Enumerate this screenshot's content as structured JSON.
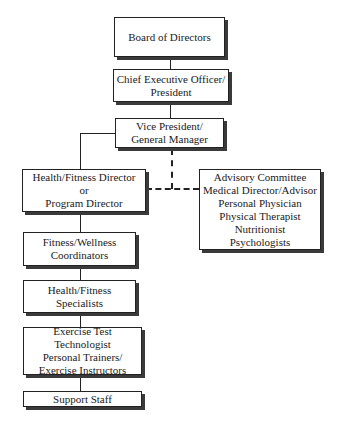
{
  "chart": {
    "type": "org-chart",
    "nodes": [
      {
        "id": "board",
        "lines": [
          "Board of Directors"
        ]
      },
      {
        "id": "ceo",
        "lines": [
          "Chief Executive Officer/",
          "President"
        ]
      },
      {
        "id": "vp",
        "lines": [
          "Vice President/",
          "General Manager"
        ]
      },
      {
        "id": "director",
        "lines": [
          "Health/Fitness Director",
          "or",
          "Program Director"
        ]
      },
      {
        "id": "advisory",
        "lines": [
          "Advisory Committee",
          "Medical Director/Advisor",
          "Personal Physician",
          "Physical Therapist",
          "Nutritionist",
          "Psychologists"
        ]
      },
      {
        "id": "coordinators",
        "lines": [
          "Fitness/Wellness",
          "Coordinators"
        ]
      },
      {
        "id": "specialists",
        "lines": [
          "Health/Fitness",
          "Specialists"
        ]
      },
      {
        "id": "exercise",
        "lines": [
          "Exercise Test Technologist",
          "Personal Trainers/",
          "Exercise Instructors"
        ]
      },
      {
        "id": "support",
        "lines": [
          "Support Staff"
        ]
      }
    ],
    "edges": [
      {
        "from": "board",
        "to": "ceo",
        "style": "solid"
      },
      {
        "from": "ceo",
        "to": "vp",
        "style": "solid"
      },
      {
        "from": "vp",
        "to": "director",
        "style": "solid"
      },
      {
        "from": "vp",
        "to": "advisory",
        "style": "dashed"
      },
      {
        "from": "director",
        "to": "advisory",
        "style": "dashed"
      },
      {
        "from": "director",
        "to": "coordinators",
        "style": "solid"
      },
      {
        "from": "coordinators",
        "to": "specialists",
        "style": "solid"
      },
      {
        "from": "specialists",
        "to": "exercise",
        "style": "solid"
      },
      {
        "from": "exercise",
        "to": "support",
        "style": "solid"
      }
    ]
  }
}
